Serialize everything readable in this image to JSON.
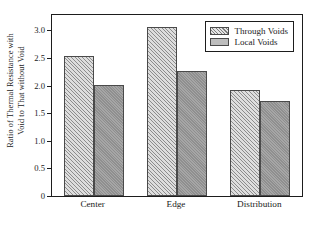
{
  "chart_data": {
    "type": "bar",
    "title": "",
    "subtitle": "",
    "xlabel": "",
    "ylabel_line1": "Ratio of Thermal Resistance with",
    "ylabel_line2": "Void to That without Void",
    "categories": [
      "Center",
      "Edge",
      "Distribution"
    ],
    "series": [
      {
        "name": "Through Voids",
        "values": [
          2.54,
          3.06,
          1.92
        ],
        "fill": "hatched-diagonal",
        "color": "#d8d8d8"
      },
      {
        "name": "Local Voids",
        "values": [
          2.02,
          2.27,
          1.72
        ],
        "fill": "solid-gray",
        "color": "#9d9d9d"
      }
    ],
    "ylim": [
      0,
      3.28
    ],
    "yticks": [
      0,
      0.5,
      1.0,
      1.5,
      2.0,
      2.5,
      3.0
    ],
    "ytick_labels": [
      "0",
      "0.5",
      "1.0",
      "1.5",
      "2.0",
      "2.5",
      "3.0"
    ],
    "grid": false,
    "legend_position": "top-right-inside",
    "frame": true,
    "axis_color": "#1d1d1d"
  },
  "legend": {
    "entries": [
      {
        "label": "Through Voids"
      },
      {
        "label": "Local Voids"
      }
    ]
  }
}
